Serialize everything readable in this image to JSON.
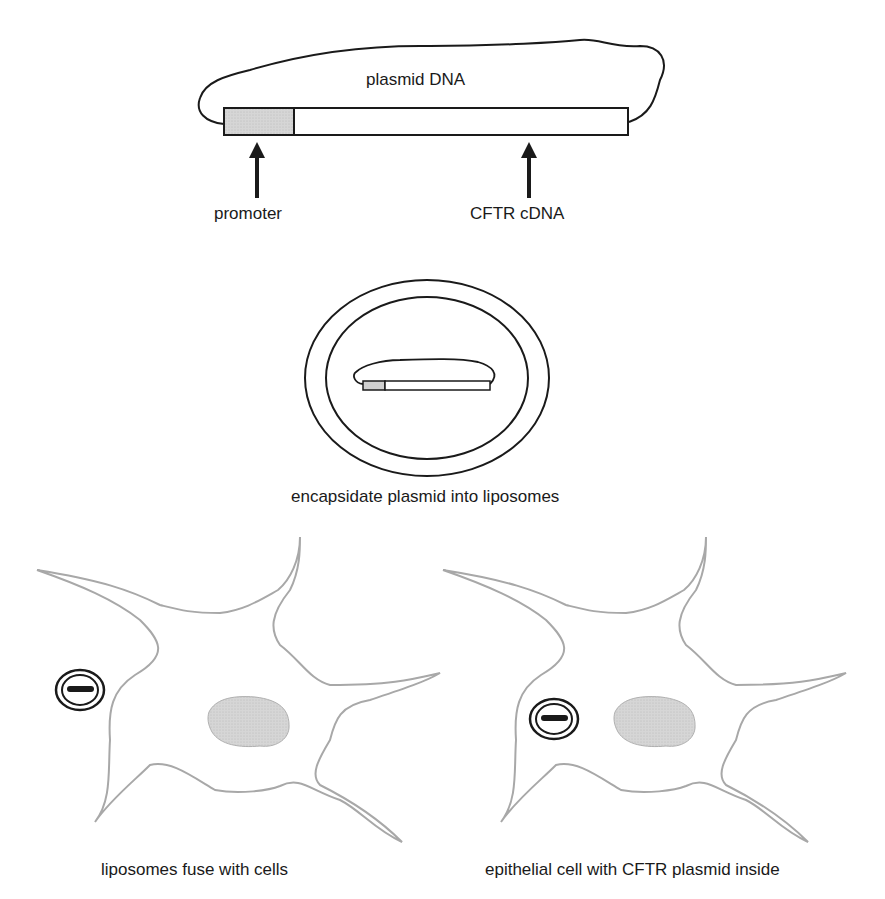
{
  "diagram": {
    "panel1": {
      "title": "plasmid DNA",
      "labels": {
        "promoter": "promoter",
        "cftr": "CFTR cDNA"
      }
    },
    "panel2": {
      "caption": "encapsidate plasmid into liposomes"
    },
    "panel3": {
      "caption": "liposomes fuse with cells"
    },
    "panel4": {
      "caption": "epithelial cell with CFTR plasmid inside"
    },
    "colors": {
      "line": "#1a1a1a",
      "promoter_fill": "#d0d0d0",
      "cell_outline": "#a8a8a8",
      "nucleus_fill": "#dcdcdc"
    }
  }
}
